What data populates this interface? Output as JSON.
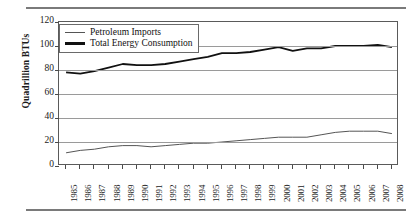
{
  "chart_data": {
    "type": "line",
    "title": "",
    "xlabel": "",
    "ylabel": "Quadrillion BTUs",
    "ylim": [
      0,
      120
    ],
    "yticks": [
      0,
      20,
      40,
      60,
      80,
      100,
      120
    ],
    "grid": true,
    "legend_position": "top-left",
    "categories": [
      "1985",
      "1986",
      "1987",
      "1988",
      "1989",
      "1990",
      "1991",
      "1992",
      "1993",
      "1994",
      "1995",
      "1996",
      "1997",
      "1998",
      "1999",
      "2000",
      "2001",
      "2002",
      "2003",
      "2004",
      "2005",
      "2006",
      "2007",
      "2008"
    ],
    "series": [
      {
        "name": "Total Energy Consumption",
        "values": [
          78,
          77,
          79,
          82,
          85,
          84,
          84,
          85,
          87,
          89,
          91,
          94,
          94,
          95,
          97,
          99,
          96,
          98,
          98,
          100,
          100,
          100,
          101,
          99
        ]
      },
      {
        "name": "Petroleum Imports",
        "values": [
          11,
          13,
          14,
          16,
          17,
          17,
          16,
          17,
          18,
          19,
          19,
          20,
          21,
          22,
          23,
          24,
          24,
          24,
          26,
          28,
          29,
          29,
          29,
          27
        ]
      }
    ]
  },
  "axes": {
    "y_title": "Quadrillion BTUs",
    "y_tick_labels": [
      "120",
      "100",
      "80",
      "60",
      "40",
      "20",
      "0"
    ]
  },
  "legend": {
    "items": [
      {
        "label": "Petroleum Imports",
        "style": "thin",
        "color": "#555555"
      },
      {
        "label": "Total Energy Consumption",
        "style": "thick",
        "color": "#111111"
      }
    ]
  },
  "colors": {
    "rule": "#7a7a7a",
    "grid": "#9a9a9a",
    "axis": "#5a5a5a",
    "series_thin": "#555555",
    "series_thick": "#111111"
  }
}
